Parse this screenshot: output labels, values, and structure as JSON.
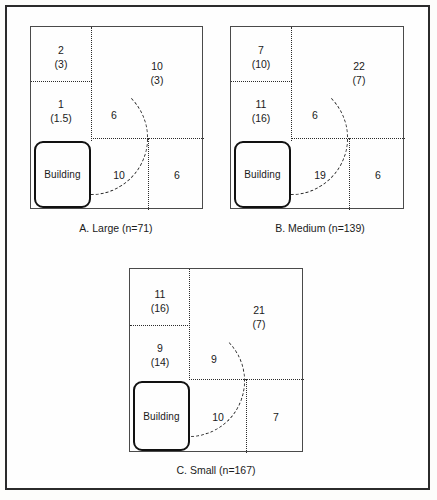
{
  "figure": {
    "type": "schematic-diagram",
    "panels": [
      {
        "id": "A",
        "caption": "A.  Large (n=71)",
        "building_label": "Building",
        "zones": [
          {
            "name": "upper-left",
            "primary": "2",
            "secondary": "(3)"
          },
          {
            "name": "mid-left",
            "primary": "1",
            "secondary": "(1.5)"
          },
          {
            "name": "upper-right",
            "primary": "10",
            "secondary": "(3)"
          },
          {
            "name": "arc-inner",
            "primary": "6",
            "secondary": ""
          },
          {
            "name": "lower-middle",
            "primary": "10",
            "secondary": ""
          },
          {
            "name": "lower-right",
            "primary": "6",
            "secondary": ""
          }
        ]
      },
      {
        "id": "B",
        "caption": "B.  Medium (n=139)",
        "building_label": "Building",
        "zones": [
          {
            "name": "upper-left",
            "primary": "7",
            "secondary": "(10)"
          },
          {
            "name": "mid-left",
            "primary": "11",
            "secondary": "(16)"
          },
          {
            "name": "upper-right",
            "primary": "22",
            "secondary": "(7)"
          },
          {
            "name": "arc-inner",
            "primary": "6",
            "secondary": ""
          },
          {
            "name": "lower-middle",
            "primary": "19",
            "secondary": ""
          },
          {
            "name": "lower-right",
            "primary": "6",
            "secondary": ""
          }
        ]
      },
      {
        "id": "C",
        "caption": "C.  Small (n=167)",
        "building_label": "Building",
        "zones": [
          {
            "name": "upper-left",
            "primary": "11",
            "secondary": "(16)"
          },
          {
            "name": "mid-left",
            "primary": "9",
            "secondary": "(14)"
          },
          {
            "name": "upper-right",
            "primary": "21",
            "secondary": "(7)"
          },
          {
            "name": "arc-inner",
            "primary": "9",
            "secondary": ""
          },
          {
            "name": "lower-middle",
            "primary": "10",
            "secondary": ""
          },
          {
            "name": "lower-right",
            "primary": "7",
            "secondary": ""
          }
        ]
      }
    ],
    "colors": {
      "ink": "#1a1a1a",
      "frame": "#2b2b2b",
      "panel_border": "#4a4a4a",
      "background": "#fefefe"
    }
  }
}
